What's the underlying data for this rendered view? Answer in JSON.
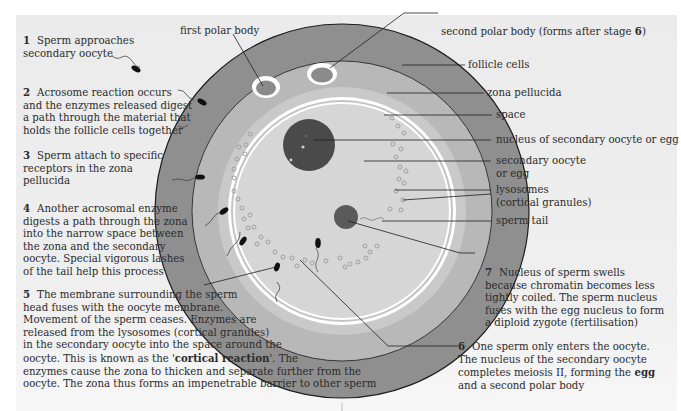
{
  "diagram": {
    "colors": {
      "background": "#ececec",
      "follicle_cells": "#8f8f8f",
      "zona_pellucida": "#b8b8b8",
      "space": "#c9c9c9",
      "oocyte": "#d6d6d6",
      "nucleus": "#4a4a4a",
      "sperm_nucleus": "#5a5a5a",
      "membrane": "#ffffff",
      "outline": "#1e1e1e",
      "text": "#2b2b2b"
    },
    "labels": {
      "first_polar_body": "first polar body",
      "second_polar_body": "second polar body (forms after stage ",
      "second_polar_body_stage": "6",
      "second_polar_body_close": ")",
      "follicle_cells": "follicle cells",
      "zona_pellucida": "zona pellucida",
      "space": "space",
      "nucleus": "nucleus of secondary oocyte or egg",
      "secondary_oocyte_1": "secondary oocyte",
      "secondary_oocyte_2": "or egg",
      "lysosomes_1": "lysosomes",
      "lysosomes_2": "(cortical granules)",
      "sperm_tail": "sperm tail"
    },
    "stages": [
      {
        "number": "1",
        "lines": [
          "Sperm approaches",
          "secondary oocyte"
        ]
      },
      {
        "number": "2",
        "lines": [
          "Acrosome reaction occurs",
          "and the enzymes released digest",
          "a path through the material that",
          "holds the follicle cells together"
        ]
      },
      {
        "number": "3",
        "lines": [
          "Sperm attach to specific",
          "receptors in the zona",
          "pellucida"
        ]
      },
      {
        "number": "4",
        "lines": [
          "Another acrosomal enzyme",
          "digests a path through the zona",
          "into the narrow space between",
          "the zona and the secondary",
          "oocyte. Special vigorous lashes",
          "of the tail help this process"
        ]
      },
      {
        "number": "5",
        "lines": [
          "The membrane surrounding the sperm",
          "head fuses with the oocyte membrane.",
          "Movement of the sperm ceases. Enzymes are",
          "released from the lysosomes (cortical granules)",
          "in the secondary oocyte into the space around the",
          "oocyte. This is known as the '",
          "cortical reaction",
          "'. The",
          "enzymes cause the zona to thicken and separate further from the",
          "oocyte. The zona thus forms an impenetrable barrier to other sperm"
        ]
      },
      {
        "number": "6",
        "lines": [
          "One sperm only enters the oocyte.",
          "The nucleus of the secondary oocyte",
          "completes meiosis II, forming the ",
          "egg",
          "and a second polar body"
        ]
      },
      {
        "number": "7",
        "lines": [
          "Nucleus of sperm swells",
          "because chromatin becomes less",
          "tightly coiled. The sperm nucleus",
          "fuses with the egg nucleus to form",
          "a diploid zygote (fertilisation)"
        ]
      }
    ]
  }
}
